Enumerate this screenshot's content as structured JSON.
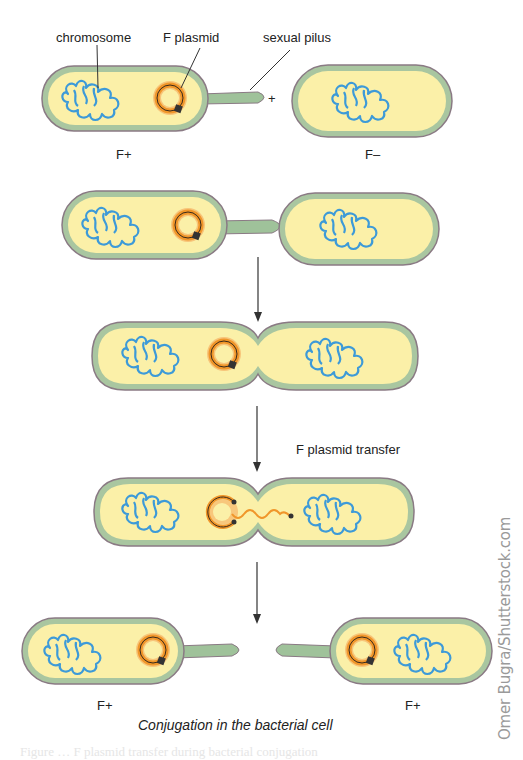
{
  "labels": {
    "chromosome": "chromosome",
    "f_plasmid": "F plasmid",
    "sexual_pilus": "sexual pilus",
    "plus_sign": "+",
    "stage1_donor": "F+",
    "stage1_recipient": "F–",
    "transfer": "F plasmid transfer",
    "final_left": "F+",
    "final_right": "F+"
  },
  "caption": "Conjugation in the bacterial cell",
  "watermark": "Omer Bugra/Shutterstock.com",
  "faded_footer": "Figure … F plasmid transfer during bacterial conjugation",
  "colors": {
    "membrane_outer": "#8a7a84",
    "wall_green": "#a9c6a0",
    "cytoplasm": "#fbf0a8",
    "chromosome": "#3d9ad8",
    "plasmid_orange": "#f0962a",
    "plasmid_core": "#333333",
    "pilus": "#9fc29a",
    "arrow": "#333333"
  },
  "stages": [
    "Donor F+ cell with F plasmid and sexual pilus approaches F– recipient",
    "Pilus attaches to recipient cell",
    "Cells pulled together, cytoplasmic bridge forms",
    "F plasmid transfer",
    "Both cells are F+"
  ]
}
